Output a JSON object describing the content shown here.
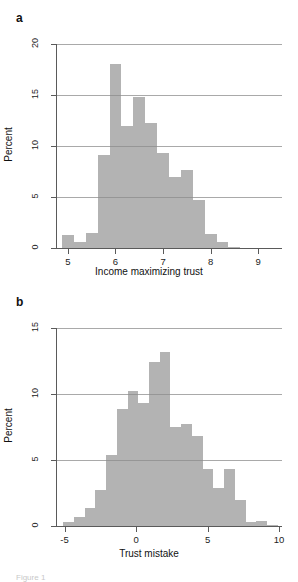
{
  "figure": {
    "caption_fragment": "Figure 1",
    "panels": [
      "a",
      "b"
    ]
  },
  "panel_a": {
    "letter": "a",
    "chart_data": {
      "type": "bar",
      "title": "",
      "xlabel": "Income maximizing trust",
      "ylabel": "Percent",
      "xlim": [
        4.75,
        9.5
      ],
      "ylim": [
        0,
        20
      ],
      "bin_width": 0.25,
      "grid": true,
      "legend": "none",
      "xticks": [
        5,
        6,
        7,
        8,
        9
      ],
      "yticks": [
        0,
        5,
        10,
        15,
        20
      ],
      "xticklabels": [
        "5",
        "6",
        "7",
        "8",
        "9"
      ],
      "yticklabels": [
        "0",
        "5",
        "10",
        "15",
        "20"
      ],
      "bar_color": "#b3b3b3",
      "bin_starts": [
        4.875,
        5.125,
        5.375,
        5.625,
        5.875,
        6.125,
        6.375,
        6.625,
        6.875,
        7.125,
        7.375,
        7.625,
        7.875,
        8.125,
        8.375
      ],
      "values": [
        1.3,
        0.55,
        1.45,
        9.1,
        18.0,
        12.0,
        14.8,
        12.3,
        9.35,
        7.0,
        7.6,
        4.7,
        1.35,
        0.55,
        0.12
      ]
    }
  },
  "panel_b": {
    "letter": "b",
    "chart_data": {
      "type": "bar",
      "title": "",
      "xlabel": "Trust mistake",
      "ylabel": "Percent",
      "xlim": [
        -5.6,
        10.2
      ],
      "ylim": [
        0,
        15
      ],
      "bin_width": 0.75,
      "grid": true,
      "legend": "none",
      "xticks": [
        -5,
        0,
        5,
        10
      ],
      "yticks": [
        0,
        5,
        10,
        15
      ],
      "xticklabels": [
        "-5",
        "0",
        "5",
        "10"
      ],
      "yticklabels": [
        "0",
        "5",
        "10",
        "15"
      ],
      "bar_color": "#b3b3b3",
      "bin_starts": [
        -5.1,
        -4.35,
        -3.6,
        -2.85,
        -2.1,
        -1.35,
        -0.6,
        0.15,
        0.9,
        1.65,
        2.4,
        3.15,
        3.9,
        4.65,
        5.4,
        6.15,
        6.9,
        7.65,
        8.4,
        9.15
      ],
      "values": [
        0.3,
        0.7,
        1.35,
        2.7,
        5.35,
        8.9,
        10.2,
        9.35,
        12.4,
        13.2,
        7.5,
        7.7,
        6.8,
        4.35,
        2.9,
        4.3,
        2.0,
        0.3,
        0.35,
        0.1
      ]
    }
  }
}
